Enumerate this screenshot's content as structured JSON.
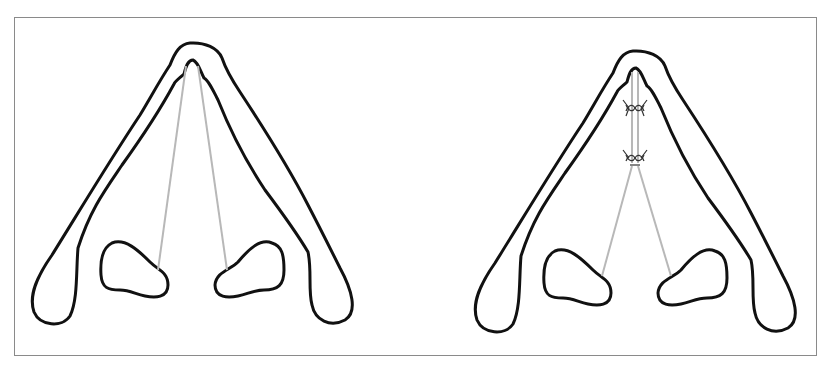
{
  "figure": {
    "panels": [
      {
        "id": "before",
        "description": "Lower lateral cartilages (alar arch) with two grey struts running from the dome apex to the nostrils",
        "struts": 2,
        "sutures": 0
      },
      {
        "id": "after",
        "description": "Lower lateral cartilages with medial crura sutured together (two suture knots) and grey struts diverging to the nostrils",
        "struts": 2,
        "sutures": 2
      }
    ],
    "colors": {
      "outline": "#111111",
      "strut": "#b8b8b8",
      "frame": "#8a8a8a",
      "background": "#ffffff"
    }
  }
}
